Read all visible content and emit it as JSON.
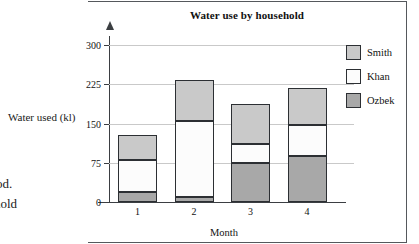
{
  "page_fragments": {
    "axis_label_left": "Water used (kl)",
    "frag_line1": "od.",
    "frag_line2": "hold"
  },
  "chart_data": {
    "type": "bar",
    "subtype": "stacked",
    "title": "Water use by household",
    "xlabel": "Month",
    "ylabel": "Water used (kl)",
    "categories": [
      "1",
      "2",
      "3",
      "4"
    ],
    "ylim": [
      0,
      300
    ],
    "yticks": [
      0,
      75,
      150,
      225,
      300
    ],
    "ytick_labels": [
      "0",
      "75",
      "150",
      "225",
      "300"
    ],
    "grid": true,
    "grid_axis": "y",
    "legend_position": "right",
    "series": [
      {
        "name": "Ozbek",
        "color": "#a8a8a8",
        "values": [
          20,
          10,
          75,
          88
        ]
      },
      {
        "name": "Khan",
        "color": "#fcfcfc",
        "values": [
          60,
          145,
          35,
          60
        ]
      },
      {
        "name": "Smith",
        "color": "#c9c9c9",
        "values": [
          48,
          78,
          78,
          70
        ]
      }
    ],
    "totals": [
      128,
      233,
      188,
      218
    ],
    "legend_order": [
      "Smith",
      "Khan",
      "Ozbek"
    ]
  },
  "colors": {
    "smith": "#c9c9c9",
    "khan": "#fcfcfc",
    "ozbek": "#a8a8a8",
    "outline": "#2c2f33",
    "axis": "#3b3e42",
    "grid": "#c9c9c9",
    "frame": "#55585c"
  }
}
